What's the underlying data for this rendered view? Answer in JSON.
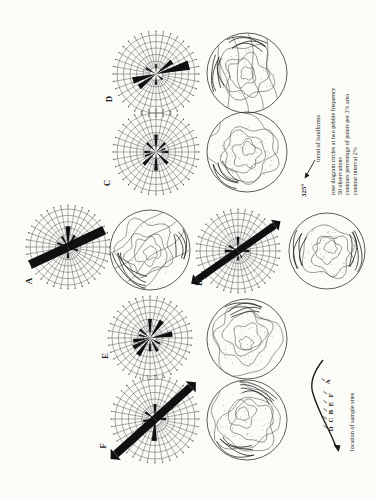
{
  "figure": {
    "legend": {
      "trend_value": "325°",
      "trend_label": "trend of landforms",
      "lines": [
        "rose diagram circles at two pebble frequency",
        "50 observations",
        "contours percentage of points per 3% area",
        "contour interval 2%"
      ]
    },
    "location_inset": {
      "caption": "location of sample sites",
      "sites_left_to_right": [
        "D",
        "C",
        "B",
        "E",
        "F",
        "A"
      ]
    },
    "sites": [
      {
        "id": "D"
      },
      {
        "id": "C"
      },
      {
        "id": "A"
      },
      {
        "id": "B"
      },
      {
        "id": "E"
      },
      {
        "id": "F"
      }
    ]
  },
  "chart_data": [
    {
      "type": "rose",
      "site": "D",
      "units": "pebble counts; grid rings every 2 pebbles; azimuth clockwise from north",
      "petals": [
        {
          "az": 165,
          "len": 0.88,
          "w": 8
        },
        {
          "az": 142,
          "len": 0.52,
          "w": 7
        },
        {
          "az": 344,
          "len": 0.62,
          "w": 8
        },
        {
          "az": 322,
          "len": 0.55,
          "w": 7
        },
        {
          "az": 90,
          "len": 0.25,
          "w": 6
        },
        {
          "az": 270,
          "len": 0.28,
          "w": 6
        },
        {
          "az": 30,
          "len": 0.3,
          "w": 6
        },
        {
          "az": 220,
          "len": 0.22,
          "w": 6
        }
      ]
    },
    {
      "type": "rose",
      "site": "C",
      "units": "pebble counts; grid rings every 2 pebbles",
      "petals": [
        {
          "az": 90,
          "len": 0.45,
          "w": 6
        },
        {
          "az": 135,
          "len": 0.33,
          "w": 6
        },
        {
          "az": 180,
          "len": 0.32,
          "w": 6
        },
        {
          "az": 225,
          "len": 0.42,
          "w": 6
        },
        {
          "az": 270,
          "len": 0.48,
          "w": 6
        },
        {
          "az": 315,
          "len": 0.45,
          "w": 6
        },
        {
          "az": 0,
          "len": 0.3,
          "w": 6
        },
        {
          "az": 45,
          "len": 0.33,
          "w": 6
        },
        {
          "az": 160,
          "len": 0.25,
          "w": 5
        },
        {
          "az": 340,
          "len": 0.3,
          "w": 5
        }
      ]
    },
    {
      "type": "rose",
      "site": "A",
      "units": "pebble counts; grid rings every 2 pebbles",
      "petals": [
        {
          "az": 155,
          "len": 1.05,
          "bw": 9
        },
        {
          "az": 335,
          "len": 1.1,
          "bw": 9
        },
        {
          "az": 90,
          "len": 0.55,
          "w": 7
        },
        {
          "az": 270,
          "len": 0.3,
          "w": 6
        },
        {
          "az": 60,
          "len": 0.32,
          "w": 6
        },
        {
          "az": 200,
          "len": 0.28,
          "w": 6
        },
        {
          "az": 20,
          "len": 0.3,
          "w": 6
        },
        {
          "az": 120,
          "len": 0.35,
          "w": 6
        }
      ]
    },
    {
      "type": "rose",
      "site": "B",
      "units": "pebble counts; grid rings every 2 pebbles",
      "petals": [
        {
          "az": 145,
          "len": 1.18,
          "bw": 7,
          "tip": true
        },
        {
          "az": 325,
          "len": 1.32,
          "bw": 7,
          "tip": true
        },
        {
          "az": 90,
          "len": 0.38,
          "w": 6
        },
        {
          "az": 180,
          "len": 0.3,
          "w": 6
        },
        {
          "az": 0,
          "len": 0.35,
          "w": 6
        },
        {
          "az": 270,
          "len": 0.25,
          "w": 6
        },
        {
          "az": 30,
          "len": 0.28,
          "w": 6
        },
        {
          "az": 240,
          "len": 0.2,
          "w": 5
        }
      ]
    },
    {
      "type": "rose",
      "site": "E",
      "units": "pebble counts; grid rings every 2 pebbles",
      "petals": [
        {
          "az": 90,
          "len": 0.5,
          "w": 6
        },
        {
          "az": 125,
          "len": 0.55,
          "w": 7
        },
        {
          "az": 170,
          "len": 0.6,
          "w": 7
        },
        {
          "az": 210,
          "len": 0.3,
          "w": 6
        },
        {
          "az": 240,
          "len": 0.4,
          "w": 6
        },
        {
          "az": 270,
          "len": 0.35,
          "w": 6
        },
        {
          "az": 305,
          "len": 0.55,
          "w": 7
        },
        {
          "az": 330,
          "len": 0.5,
          "w": 7
        },
        {
          "az": 350,
          "len": 0.45,
          "w": 7
        },
        {
          "az": 40,
          "len": 0.35,
          "w": 6
        },
        {
          "az": 15,
          "len": 0.3,
          "w": 5
        }
      ]
    },
    {
      "type": "rose",
      "site": "F",
      "units": "pebble counts; grid rings every 2 pebbles",
      "petals": [
        {
          "az": 138,
          "len": 1.2,
          "bw": 8,
          "tip": true
        },
        {
          "az": 318,
          "len": 1.32,
          "bw": 8,
          "tip": true
        },
        {
          "az": 90,
          "len": 0.38,
          "w": 6
        },
        {
          "az": 272,
          "len": 0.55,
          "w": 7
        },
        {
          "az": 350,
          "len": 0.3,
          "w": 6
        },
        {
          "az": 180,
          "len": 0.28,
          "w": 6
        },
        {
          "az": 35,
          "len": 0.3,
          "w": 6
        }
      ]
    },
    {
      "type": "contour-set",
      "sites": [
        "D",
        "C",
        "A",
        "B",
        "E",
        "F"
      ],
      "contour_interval": "2%",
      "density": "percentage of points per 3% area",
      "n": "50 observations"
    }
  ]
}
